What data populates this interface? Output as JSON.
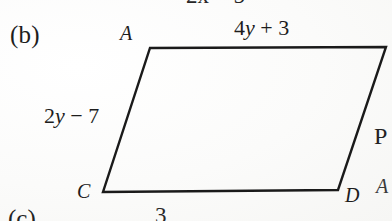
{
  "figure": {
    "part_label": "(b)",
    "shape": "parallelogram",
    "background_color": "#fdfdfc",
    "stroke_color": "#1a1a1a",
    "vertices": [
      {
        "name": "vertex-a",
        "label": "A",
        "x": 150,
        "y": 48,
        "label_x": 120,
        "label_y": 23
      },
      {
        "name": "vertex-top-right",
        "label": "",
        "x": 386,
        "y": 47,
        "label_x": 0,
        "label_y": 0
      },
      {
        "name": "vertex-d",
        "label": "D",
        "x": 338,
        "y": 190,
        "label_x": 345,
        "label_y": 185
      },
      {
        "name": "vertex-c",
        "label": "C",
        "x": 103,
        "y": 192,
        "label_x": 77,
        "label_y": 181
      }
    ],
    "side_labels": [
      {
        "name": "side-top",
        "text": "4y + 3",
        "coefficient": "4",
        "variable": "y",
        "operator": "+",
        "constant": "3",
        "x": 234,
        "y": 17
      },
      {
        "name": "side-left",
        "text": "2y − 7",
        "coefficient": "2",
        "variable": "y",
        "operator": "−",
        "constant": "7",
        "x": 44,
        "y": 105
      }
    ]
  },
  "clipped": {
    "top_expression": "2x − 5",
    "right_letter": "P",
    "right_mark": "A",
    "bottom_part_label": "(c)",
    "bottom_expression": "3"
  }
}
